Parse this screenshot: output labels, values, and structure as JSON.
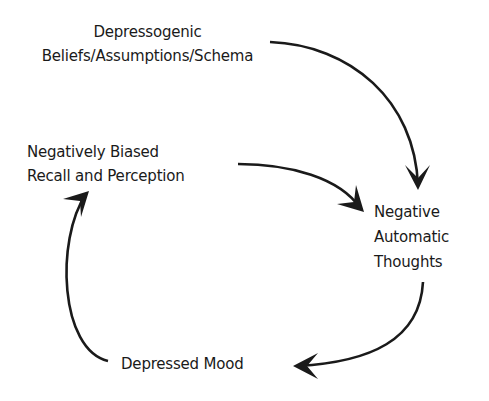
{
  "diagram": {
    "type": "cycle",
    "nodes": [
      {
        "id": "beliefs",
        "lines": [
          "Depressogenic",
          "Beliefs/Assumptions/Schema"
        ]
      },
      {
        "id": "recall",
        "lines": [
          "Negatively Biased",
          "Recall and Perception"
        ]
      },
      {
        "id": "nat",
        "lines": [
          "Negative",
          "Automatic",
          "Thoughts"
        ]
      },
      {
        "id": "mood",
        "lines": [
          "Depressed Mood"
        ]
      }
    ],
    "edges": [
      {
        "from": "beliefs",
        "to": "nat"
      },
      {
        "from": "recall",
        "to": "nat"
      },
      {
        "from": "nat",
        "to": "mood"
      },
      {
        "from": "mood",
        "to": "recall"
      }
    ],
    "colors": {
      "ink": "#1a1a1a",
      "background": "#ffffff"
    }
  }
}
